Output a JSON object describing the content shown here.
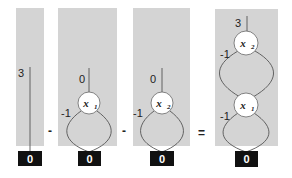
{
  "diagram": {
    "panels": [
      {
        "id": "p1",
        "root_weight": "3",
        "nodes": [],
        "terminal": "0"
      },
      {
        "id": "p2",
        "root_weight": "0",
        "nodes": [
          {
            "var": "x",
            "sub": "1",
            "edge_weight": "-1"
          }
        ],
        "terminal": "0"
      },
      {
        "id": "p3",
        "root_weight": "0",
        "nodes": [
          {
            "var": "x",
            "sub": "2",
            "edge_weight": "-1"
          }
        ],
        "terminal": "0"
      },
      {
        "id": "p4",
        "root_weight": "3",
        "nodes": [
          {
            "var": "x",
            "sub": "2",
            "edge_weight": "-1"
          },
          {
            "var": "x",
            "sub": "1",
            "edge_weight": "-1"
          }
        ],
        "terminal": "0"
      }
    ],
    "operators": [
      "-",
      "-",
      "="
    ],
    "colors": {
      "panel": "#d4d4d4",
      "terminal": "#111111",
      "node": "#ffffff"
    }
  }
}
